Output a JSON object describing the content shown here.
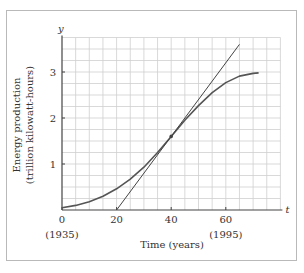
{
  "chart_data": {
    "type": "line",
    "title": "",
    "xlabel": "Time (years)",
    "ylabel": "Energy production (trillion kilowatt-hours)",
    "x_axis_var": "t",
    "y_axis_var": "y",
    "xlim": [
      0,
      80
    ],
    "ylim": [
      0,
      3.75
    ],
    "grid": true,
    "x_ticks": [
      {
        "value": 0,
        "label": "0",
        "sublabel": "(1935)"
      },
      {
        "value": 20,
        "label": "20",
        "sublabel": ""
      },
      {
        "value": 40,
        "label": "40",
        "sublabel": ""
      },
      {
        "value": 60,
        "label": "60",
        "sublabel": "(1995)"
      }
    ],
    "y_ticks": [
      {
        "value": 1,
        "label": "1"
      },
      {
        "value": 2,
        "label": "2"
      },
      {
        "value": 3,
        "label": "3"
      }
    ],
    "series": [
      {
        "name": "Energy production curve",
        "x": [
          0,
          5,
          10,
          15,
          20,
          25,
          30,
          35,
          40,
          45,
          50,
          55,
          60,
          65,
          70,
          72
        ],
        "values": [
          0.05,
          0.1,
          0.18,
          0.3,
          0.46,
          0.67,
          0.93,
          1.25,
          1.6,
          1.95,
          2.27,
          2.55,
          2.77,
          2.91,
          2.97,
          2.98
        ]
      },
      {
        "name": "Tangent line at t=40",
        "x": [
          20,
          65
        ],
        "values": [
          0,
          3.6
        ]
      }
    ],
    "annotations": [
      {
        "type": "point",
        "x": 40,
        "y": 1.6,
        "label": "point of tangency"
      }
    ]
  }
}
